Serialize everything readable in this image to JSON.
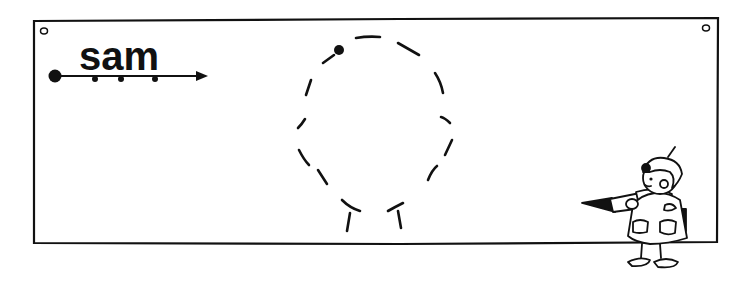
{
  "worksheet": {
    "word": "sam",
    "colors": {
      "ink": "#111111",
      "paper": "#ffffff"
    },
    "tracing_guide": {
      "start_dot": true,
      "letter_dots": 3,
      "arrow_direction": "right"
    },
    "trace_shape": "dashed-head-outline",
    "character": "child-holding-pencil"
  }
}
